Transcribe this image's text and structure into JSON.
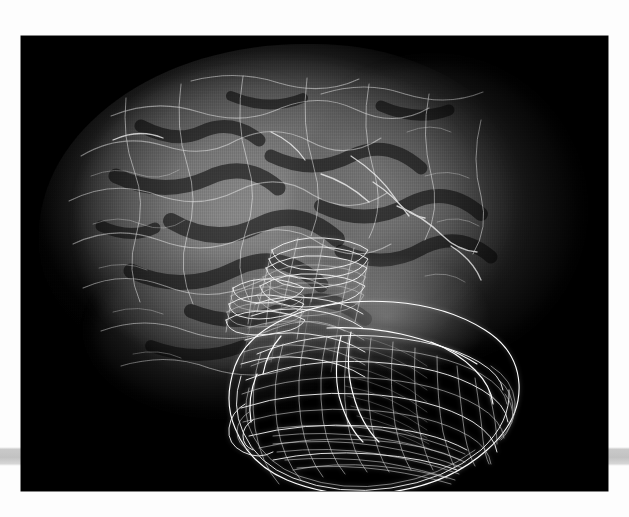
{
  "figure": {
    "kind": "medical-volume-rendering",
    "caption": "",
    "canvas": {
      "background_color": "#000000",
      "left": 21,
      "top": 36,
      "width": 587,
      "height": 455
    },
    "page": {
      "background_color": "#fdfdfd",
      "scan_bar_color": "#c2c2c2",
      "scan_bar_top": 447,
      "scan_bar_height": 19
    }
  },
  "objects": [
    {
      "id": "brain-volume",
      "label": "translucent volume-rendered brain",
      "render_style": "semi-transparent direct volume rendering",
      "color": "#8a8a8a",
      "opacity": 0.55,
      "notes": "cortical surface showing sulci and gyri, fades to black at the silhouette edge"
    },
    {
      "id": "wireframe-mesh",
      "label": "white wireframe contour mesh",
      "render_style": "stacked planar contours with connecting ribs",
      "color": "#ffffff",
      "opacity": 1.0,
      "notes": "segmented anatomical structure overlaid on the lower-right of the brain volume; upper part shows flat stacked slice outlines, lower part a dense cross-hatched surface mesh"
    }
  ],
  "chart_data": {
    "type": "scatter",
    "title": "",
    "xlabel": "",
    "ylabel": "",
    "grid": false,
    "legend": "none"
  },
  "accessibility": {
    "alt_text": "Black-background 3D visualization: a faint grey semi-transparent brain seen from the side, with a bright white wireframe mesh of a segmented structure overlaid in the lower right quadrant."
  }
}
